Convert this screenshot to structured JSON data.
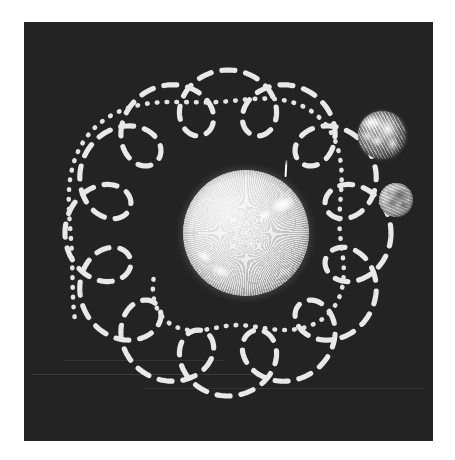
{
  "figure": {
    "background_color": "#ffffff",
    "panel": {
      "x": 24,
      "y": 22,
      "width": 409,
      "height": 419,
      "background_color": "#232323",
      "grain": true
    }
  },
  "palette": {
    "panel_dark": "#232323",
    "orbit_line": "#e9e9e9",
    "moon_track": "#e4e4e4",
    "sun_bright": "#f2f2f2",
    "page_white": "#ffffff"
  },
  "bodies": [
    {
      "id": "sun",
      "label": "Sun",
      "cx": 222,
      "cy": 211,
      "r": 63,
      "type": "star",
      "surface": "granulation",
      "features": [
        "active-region-northeast",
        "active-region-southwest",
        "polar-prominence"
      ],
      "prominence": {
        "x": 103,
        "y": -10,
        "height": 17
      }
    },
    {
      "id": "earth",
      "label": "Earth",
      "cx": 358,
      "cy": 113,
      "r": 24,
      "type": "planet",
      "surface": "continents-and-clouds"
    },
    {
      "id": "moon",
      "label": "Moon",
      "cx": 372,
      "cy": 178,
      "r": 17,
      "type": "satellite",
      "surface": "craters-and-maria"
    }
  ],
  "orbits": {
    "earth_path": {
      "name": "earth-epicycloid-orbit",
      "style": "dashed",
      "stroke": "#e9e9e9",
      "stroke_width": 5.2,
      "dash_pattern": "13 11",
      "linecap": "round",
      "geometry": {
        "kind": "epitrochoid",
        "center": [
          204,
          211
        ],
        "R": 132,
        "r": 31,
        "d": 31,
        "cusps": 13,
        "samples": 1400
      }
    },
    "moon_path": {
      "name": "moon-spiral-track",
      "style": "dotted",
      "stroke": "#e4e4e4",
      "stroke_width": 4.6,
      "dash_pattern": "0.6 9.2",
      "linecap": "round",
      "geometry": {
        "kind": "spiral-arc",
        "center": [
          204,
          214
        ],
        "r_start": 86,
        "r_end": 176,
        "theta_start_deg": 150,
        "theta_end_deg": -210,
        "wobble_amplitude": 13,
        "wobble_cycles": 4,
        "samples": 900
      }
    }
  },
  "artifacts": {
    "streaks": [
      {
        "x": 8,
        "y": 352,
        "width": 220,
        "opacity": 0.1
      },
      {
        "x": 120,
        "y": 366,
        "width": 280,
        "opacity": 0.08
      },
      {
        "x": 40,
        "y": 338,
        "width": 160,
        "opacity": 0.07
      }
    ]
  }
}
